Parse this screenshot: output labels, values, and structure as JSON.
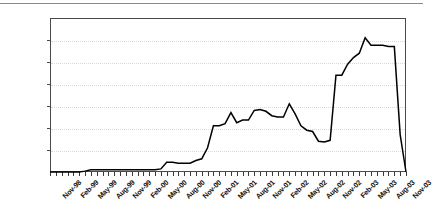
{
  "chart_data": {
    "type": "line",
    "title": "",
    "subtitle": "",
    "xlabel": "",
    "ylabel": "",
    "ylim": [
      0,
      3.5
    ],
    "ytick_values": [
      0.0,
      0.5,
      1.0,
      1.5,
      2.0,
      2.5,
      3.0,
      3.5
    ],
    "ytick_labels": [
      "0.0%",
      "0.5",
      "1.0",
      "1.5",
      "2.0",
      "2.5",
      "3.0",
      "3.5%"
    ],
    "grid": true,
    "legend": "none",
    "series_color": "#000000",
    "axis_color": "#4a4a4a",
    "grid_color": "#d9d9d9",
    "xtick_labels": [
      "Nov-98",
      "Feb-99",
      "May-99",
      "Aug-99",
      "Nov-99",
      "Feb-00",
      "May-00",
      "Aug-00",
      "Nov-00",
      "Feb-01",
      "May-01",
      "Aug-01",
      "Nov-01",
      "Feb-02",
      "May-02",
      "Aug-02",
      "Nov-02",
      "Feb-03",
      "May-03",
      "Aug-03",
      "Nov-03"
    ],
    "x_labels_monthly": [
      "Nov-98",
      "Dec-98",
      "Jan-99",
      "Feb-99",
      "Mar-99",
      "Apr-99",
      "May-99",
      "Jun-99",
      "Jul-99",
      "Aug-99",
      "Sep-99",
      "Oct-99",
      "Nov-99",
      "Dec-99",
      "Jan-00",
      "Feb-00",
      "Mar-00",
      "Apr-00",
      "May-00",
      "Jun-00",
      "Jul-00",
      "Aug-00",
      "Sep-00",
      "Oct-00",
      "Nov-00",
      "Dec-00",
      "Jan-01",
      "Feb-01",
      "Mar-01",
      "Apr-01",
      "May-01",
      "Jun-01",
      "Jul-01",
      "Aug-01",
      "Sep-01",
      "Oct-01",
      "Nov-01",
      "Dec-01",
      "Jan-02",
      "Feb-02",
      "Mar-02",
      "Apr-02",
      "May-02",
      "Jun-02",
      "Jul-02",
      "Aug-02",
      "Sep-02",
      "Oct-02",
      "Nov-02",
      "Dec-02",
      "Jan-03",
      "Feb-03",
      "Mar-03",
      "Apr-03",
      "May-03",
      "Jun-03",
      "Jul-03",
      "Aug-03",
      "Sep-03",
      "Oct-03",
      "Nov-03",
      "Dec-03"
    ],
    "values": [
      0.0,
      0.0,
      0.0,
      0.0,
      0.0,
      0.0,
      0.02,
      0.05,
      0.05,
      0.05,
      0.05,
      0.05,
      0.05,
      0.05,
      0.05,
      0.05,
      0.05,
      0.05,
      0.05,
      0.07,
      0.22,
      0.22,
      0.2,
      0.2,
      0.2,
      0.26,
      0.3,
      0.55,
      1.05,
      1.05,
      1.1,
      1.35,
      1.12,
      1.18,
      1.18,
      1.4,
      1.42,
      1.38,
      1.28,
      1.25,
      1.25,
      1.55,
      1.32,
      1.05,
      0.95,
      0.92,
      0.7,
      0.68,
      0.72,
      2.2,
      2.2,
      2.45,
      2.6,
      2.7,
      3.05,
      2.88,
      2.88,
      2.88,
      2.85,
      2.85,
      0.85,
      0.0
    ],
    "units": "percent",
    "peak_value": 3.05,
    "peak_label": "May-03",
    "min_value": 0.0
  }
}
